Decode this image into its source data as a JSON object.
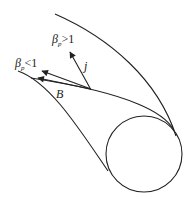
{
  "diagram": {
    "labels": {
      "beta_high": {
        "symbol": "β",
        "subscript": "p",
        "relation": ">1"
      },
      "beta_low": {
        "symbol": "β",
        "subscript": "p",
        "relation": "<1"
      },
      "current": "j",
      "field": "B"
    },
    "colors": {
      "stroke": "#222222",
      "background": "#ffffff"
    }
  }
}
